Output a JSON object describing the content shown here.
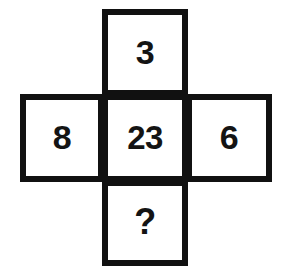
{
  "figure": {
    "kind": "number-puzzle-cross-grid",
    "background_color": "#ffffff",
    "border_color": "#111111",
    "text_color": "#141414",
    "cells": [
      {
        "position": "top",
        "value": "3",
        "name": "cell-top"
      },
      {
        "position": "left",
        "value": "8",
        "name": "cell-left"
      },
      {
        "position": "center",
        "value": "23",
        "name": "cell-center"
      },
      {
        "position": "right",
        "value": "6",
        "name": "cell-right"
      },
      {
        "position": "bottom",
        "value": "?",
        "name": "cell-bottom"
      }
    ]
  },
  "chart_data": {
    "type": "table",
    "title": "",
    "xlabel": "",
    "ylabel": "",
    "categories": [
      "top",
      "left",
      "center",
      "right",
      "bottom"
    ],
    "values": [
      "3",
      "8",
      "23",
      "6",
      "?"
    ],
    "layout": "plus-shaped cross: one cell above center, one below, one left, one right",
    "grid": true,
    "legend": "none"
  }
}
